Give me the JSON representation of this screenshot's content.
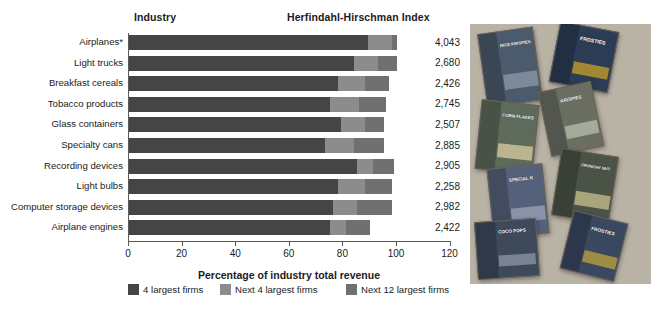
{
  "headers": {
    "industry": "Industry",
    "hhi": "Herfindahl-Hirschman Index"
  },
  "axis": {
    "title": "Percentage of industry total revenue",
    "ticks": [
      "0",
      "20",
      "40",
      "60",
      "80",
      "100",
      "120"
    ],
    "tick_values": [
      0,
      20,
      40,
      60,
      80,
      100,
      120
    ]
  },
  "legend": [
    {
      "label": "4 largest firms",
      "color": "#454545"
    },
    {
      "label": "Next 4 largest firms",
      "color": "#8c8c8c"
    },
    {
      "label": "Next 12 largest firms",
      "color": "#707070"
    }
  ],
  "colors": {
    "seg1": "#454545",
    "seg2": "#8c8c8c",
    "seg3": "#707070",
    "axis": "#5a5a5a",
    "photo_bg": "#b9b3a6"
  },
  "chart_data": {
    "type": "bar",
    "orientation": "horizontal",
    "stacked": true,
    "title": "",
    "xlabel": "Percentage of industry total revenue",
    "ylabel": "Industry",
    "xlim": [
      0,
      120
    ],
    "grid": false,
    "legend_position": "bottom",
    "categories": [
      "Airplanes*",
      "Light trucks",
      "Breakfast cereals",
      "Tobacco products",
      "Glass containers",
      "Specialty cans",
      "Recording devices",
      "Light bulbs",
      "Computer storage devices",
      "Airplane engines"
    ],
    "series": [
      {
        "name": "4 largest firms",
        "values": [
          89,
          84,
          78,
          75,
          79,
          73,
          85,
          78,
          76,
          75
        ]
      },
      {
        "name": "Next 4 largest firms",
        "values": [
          9,
          9,
          10,
          11,
          9,
          11,
          6,
          10,
          9,
          6
        ]
      },
      {
        "name": "Next 12 largest firms",
        "values": [
          2,
          7,
          9,
          10,
          7,
          11,
          8,
          10,
          13,
          9
        ]
      }
    ],
    "annotations": {
      "hhi_label": "Herfindahl-Hirschman Index",
      "hhi_values": [
        "4,043",
        "2,680",
        "2,426",
        "2,745",
        "2,507",
        "2,885",
        "2,905",
        "2,258",
        "2,982",
        "2,422"
      ]
    },
    "footnote": "*"
  },
  "photo": {
    "name": "cereal-boxes-photo",
    "boxes": [
      {
        "label": "RICE KRISPIES",
        "x": 12,
        "y": 6,
        "w": 56,
        "h": 74,
        "rot": -8,
        "color": "#4c5a6e",
        "accent": "#8e9aa8",
        "fs": 4.2
      },
      {
        "label": "FROSTIES",
        "x": 84,
        "y": 2,
        "w": 60,
        "h": 62,
        "rot": 11,
        "color": "#2c3c55",
        "accent": "#c9a227",
        "fs": 5.2
      },
      {
        "label": "CORN FLAKES",
        "x": 8,
        "y": 78,
        "w": 58,
        "h": 70,
        "rot": 6,
        "color": "#5e6a5a",
        "accent": "#d9cfa3",
        "fs": 4.4
      },
      {
        "label": "KRISPIES",
        "x": 74,
        "y": 62,
        "w": 54,
        "h": 66,
        "rot": -12,
        "color": "#6a6f62",
        "accent": "#b9bdae",
        "fs": 4.6
      },
      {
        "label": "SPECIAL K",
        "x": 20,
        "y": 142,
        "w": 56,
        "h": 70,
        "rot": -6,
        "color": "#55607a",
        "accent": "#9aa4b8",
        "fs": 4.6
      },
      {
        "label": "CRUNCHY NUT",
        "x": 86,
        "y": 128,
        "w": 58,
        "h": 68,
        "rot": 9,
        "color": "#4a5346",
        "accent": "#cbbf8f",
        "fs": 4.0
      },
      {
        "label": "COCO POPS",
        "x": 6,
        "y": 196,
        "w": 62,
        "h": 58,
        "rot": -4,
        "color": "#3e4a5c",
        "accent": "#8b96a6",
        "fs": 4.6
      },
      {
        "label": "FROSTIES",
        "x": 96,
        "y": 192,
        "w": 56,
        "h": 60,
        "rot": 14,
        "color": "#3a4760",
        "accent": "#c2a33a",
        "fs": 4.8
      }
    ]
  }
}
